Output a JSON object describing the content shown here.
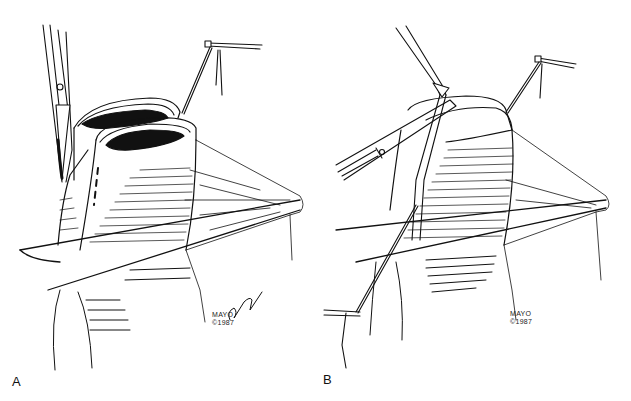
{
  "figure": {
    "panels": [
      {
        "id": "A",
        "label": "A",
        "copyright": {
          "line1": "MAYO",
          "line2": "©1987"
        },
        "signature": "signature",
        "elements": [
          "clamp-left",
          "bowel-loops-open",
          "dashed-incision-line",
          "stay-suture-with-holder",
          "mesentery",
          "bowel-base"
        ]
      },
      {
        "id": "B",
        "label": "B",
        "copyright": {
          "line1": "MAYO",
          "line2": "©1987"
        },
        "elements": [
          "forceps",
          "needle-holder",
          "bowel-loop",
          "stay-suture-top",
          "suture-with-holder-bottom",
          "mesentery",
          "bowel-base"
        ]
      }
    ],
    "colors": {
      "ink": "#111111",
      "background": "#ffffff"
    }
  }
}
